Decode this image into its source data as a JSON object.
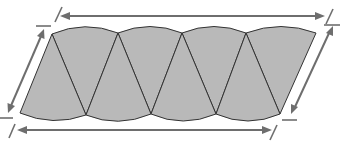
{
  "diagram": {
    "colors": {
      "sector_fill": "#b9b9b9",
      "sector_stroke": "#333333",
      "dimension_line": "#6e6e6e",
      "background": "#ffffff"
    },
    "sectors": {
      "count": 8,
      "up_pointing": 4,
      "down_pointing": 4,
      "top_cusps": [
        [
          52,
          34
        ],
        [
          118,
          33
        ],
        [
          182,
          33
        ],
        [
          246,
          33
        ],
        [
          316,
          33
        ]
      ],
      "bottom_cusps": [
        [
          20,
          113
        ],
        [
          86,
          115
        ],
        [
          151,
          114
        ],
        [
          216,
          114
        ],
        [
          280,
          114
        ]
      ]
    },
    "dimension_arrows": [
      {
        "name": "top-length",
        "from": [
          60,
          16
        ],
        "to": [
          325,
          16
        ],
        "double_headed": true
      },
      {
        "name": "bottom-length",
        "from": [
          17,
          130
        ],
        "to": [
          272,
          130
        ],
        "double_headed": true
      },
      {
        "name": "left-side",
        "from": [
          44,
          29
        ],
        "to": [
          8,
          113
        ],
        "double_headed": true
      },
      {
        "name": "right-side",
        "from": [
          333,
          26
        ],
        "to": [
          292,
          114
        ],
        "double_headed": true
      }
    ],
    "labels": []
  }
}
